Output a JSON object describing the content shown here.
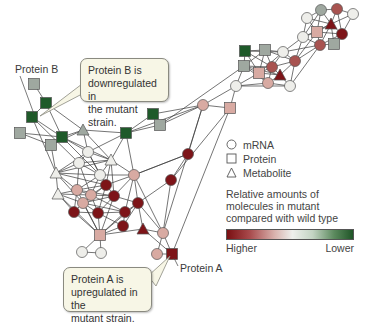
{
  "labels": {
    "protein_b": "Protein B",
    "protein_a": "Protein A"
  },
  "callouts": {
    "protein_b": {
      "lines": [
        "Protein B is",
        "downregulated in",
        "the mutant strain."
      ]
    },
    "protein_a": {
      "lines": [
        "Protein A is",
        "upregulated in the",
        "mutant strain."
      ]
    }
  },
  "legend": {
    "shapes": [
      {
        "shape": "circle",
        "label": "mRNA"
      },
      {
        "shape": "square",
        "label": "Protein"
      },
      {
        "shape": "triangle",
        "label": "Metabolite"
      }
    ],
    "scale_title": [
      "Relative amounts of",
      "molecules in mutant",
      "compared with wild type"
    ],
    "scale_low_end": "Higher",
    "scale_high_end": "Lower"
  },
  "colors": {
    "dark_red": "#7d1418",
    "medium_red": "#a85350",
    "pink": "#d8aaa2",
    "white": "#eeeeea",
    "grey": "#9fa8a0",
    "dark_green": "#1f5a2a",
    "edge": "#333333"
  }
}
